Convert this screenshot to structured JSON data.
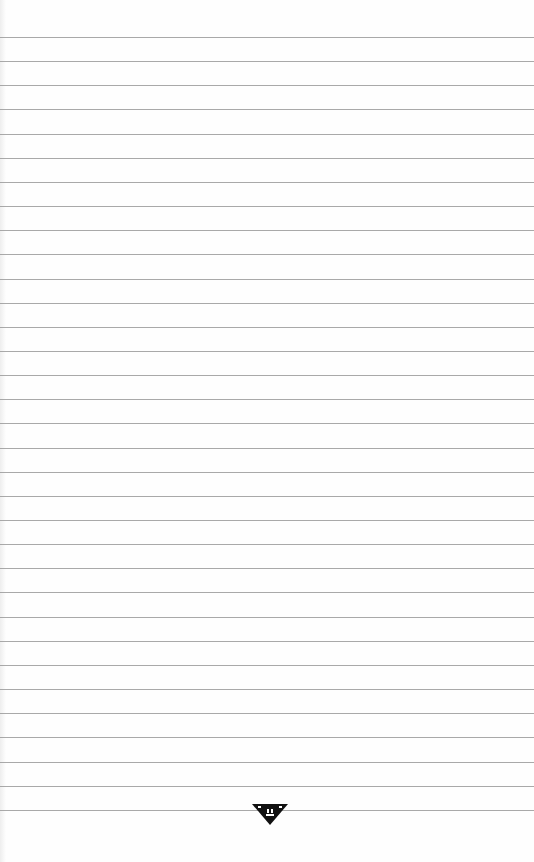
{
  "page": {
    "type": "lined-notepaper",
    "background_color": "#fefefe",
    "line_color": "#9a9a9a",
    "line_count": 33,
    "first_line_y": 37,
    "line_spacing": 24.15
  },
  "footer": {
    "logo_icon": "inverted-triangle-emblem-icon",
    "logo_color": "#111111"
  }
}
